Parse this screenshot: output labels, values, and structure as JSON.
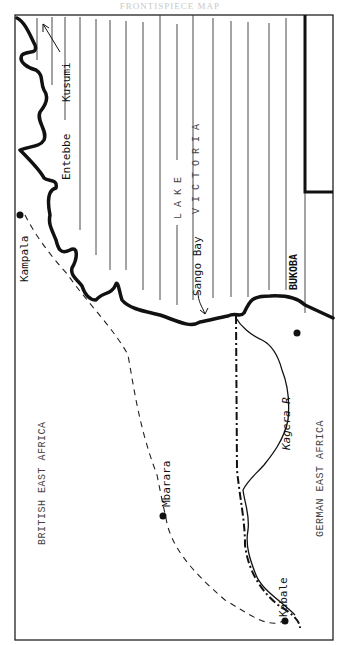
{
  "page": {
    "header": "FRONTISPIECE MAP",
    "width": 340,
    "height": 645
  },
  "map": {
    "orientation": "rotated 90° counter-clockwise (labels read bottom-to-top)",
    "regions": {
      "british_east_africa": "BRITISH EAST AFRICA",
      "german_east_africa": "GERMAN EAST AFRICA",
      "lake_word": "LAKE",
      "lake_name": "V I C T O R I A"
    },
    "places": {
      "kusumi": "Kusumi",
      "entebbe": "Entebbe",
      "kampala": "Kampala",
      "sango_bay": "Sango Bay",
      "bukoba": "BUKOBA",
      "mbarara": "Mbarara",
      "kabale": "Kabale"
    },
    "rivers": {
      "kagera": "Kagera R"
    },
    "legend_implied": {
      "shoreline": "thick solid line",
      "route": "dashed line",
      "border": "dash-dot line",
      "river": "thin solid line",
      "town": "filled dot",
      "lake": "vertical hatching"
    },
    "colors": {
      "ink": "#111111",
      "paper": "#ffffff",
      "header": "#c8c8c8"
    }
  }
}
